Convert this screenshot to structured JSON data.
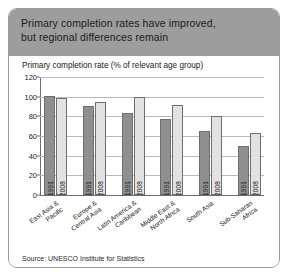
{
  "figure": {
    "header": {
      "line1": "Primary completion rates have improved,",
      "line2": "but regional differences remain"
    },
    "axis_title": "Primary completion rate (% of relevant age group)",
    "source": "Source: UNESCO Institute for Statistics"
  },
  "colors": {
    "header_background": "#9d9d9d",
    "series_1991": "#8f8f8f",
    "series_2008": "#e2e2e2",
    "bar_outline": "#6f6f6f",
    "gridline": "#b9b9b9",
    "frame_border": "#9a9a9a"
  },
  "chart_data": {
    "type": "bar",
    "title": "Primary completion rates have improved, but regional differences remain",
    "subtitle": "Primary completion rate (% of relevant age group)",
    "xlabel": "",
    "ylabel": "Primary completion rate (% of relevant age group)",
    "ylim": [
      0,
      120
    ],
    "yticks": [
      0,
      20,
      40,
      60,
      80,
      100,
      120
    ],
    "ytick_labels": [
      "0",
      "20",
      "40",
      "60",
      "80",
      "100",
      "120"
    ],
    "grid": true,
    "legend": "none",
    "source": "Source: UNESCO Institute for Statistics",
    "categories": [
      "East Asia &\nPacific",
      "Europe &\nCentral Asia",
      "Latin America &\nCaribbean",
      "Middle East &\nNorth Africa",
      "South Asia",
      "Sub-Saharan\nAfrica"
    ],
    "category_labels": [
      {
        "line1": "East Asia &",
        "line2": "Pacific"
      },
      {
        "line1": "Europe &",
        "line2": "Central Asia"
      },
      {
        "line1": "Latin America &",
        "line2": "Caribbean"
      },
      {
        "line1": "Middle East &",
        "line2": "North Africa"
      },
      {
        "line1": "South Asia",
        "line2": ""
      },
      {
        "line1": "Sub-Saharan",
        "line2": "Africa"
      }
    ],
    "series": [
      {
        "name": "1991",
        "values": [
          101,
          91,
          83,
          77,
          65,
          50
        ]
      },
      {
        "name": "2008",
        "values": [
          99,
          95,
          100,
          92,
          80,
          63
        ]
      }
    ],
    "bars": [
      {
        "category": "East Asia & Pacific",
        "year": "1991",
        "value": 101
      },
      {
        "category": "East Asia & Pacific",
        "year": "2008",
        "value": 99
      },
      {
        "category": "Europe & Central Asia",
        "year": "1991",
        "value": 91
      },
      {
        "category": "Europe & Central Asia",
        "year": "2008",
        "value": 95
      },
      {
        "category": "Latin America & Caribbean",
        "year": "1991",
        "value": 83
      },
      {
        "category": "Latin America & Caribbean",
        "year": "2008",
        "value": 100
      },
      {
        "category": "Middle East & North Africa",
        "year": "1991",
        "value": 77
      },
      {
        "category": "Middle East & North Africa",
        "year": "2008",
        "value": 92
      },
      {
        "category": "South Asia",
        "year": "1991",
        "value": 65
      },
      {
        "category": "South Asia",
        "year": "2008",
        "value": 80
      },
      {
        "category": "Sub-Saharan Africa",
        "year": "1991",
        "value": 50
      },
      {
        "category": "Sub-Saharan Africa",
        "year": "2008",
        "value": 63
      }
    ]
  }
}
